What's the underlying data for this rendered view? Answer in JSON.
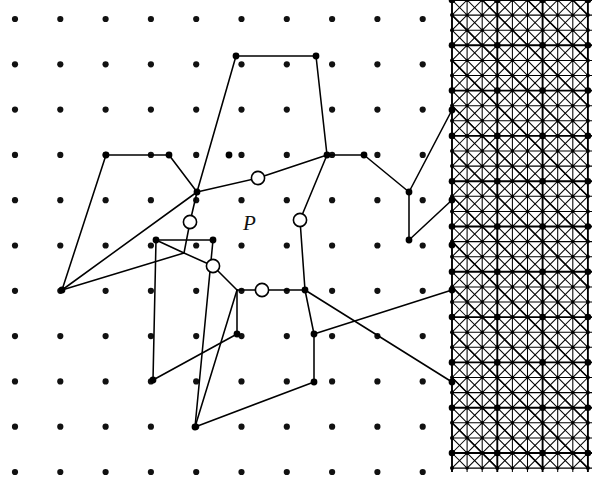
{
  "figure": {
    "width": 592,
    "height": 484,
    "background_color": "#ffffff",
    "stroke_color": "#000000",
    "label": {
      "text": "P",
      "x": 243,
      "y": 213,
      "style": "italic-serif"
    },
    "lattice": {
      "description": "background dot grid",
      "dot_radius": 3.1,
      "color": "#111111",
      "x_start": 15,
      "y_start": 19,
      "spacing_x": 45.3,
      "spacing_y": 45.3,
      "cols": 10,
      "rows": 11
    },
    "solid_vertices": {
      "radius": 3.4,
      "points": [
        [
          106,
          155
        ],
        [
          169,
          155
        ],
        [
          229,
          155
        ],
        [
          197,
          192
        ],
        [
          236,
          56
        ],
        [
          316,
          56
        ],
        [
          327,
          155
        ],
        [
          364,
          155
        ],
        [
          409,
          192
        ],
        [
          409,
          240
        ],
        [
          452,
          110
        ],
        [
          452,
          200
        ],
        [
          452,
          245
        ],
        [
          452,
          290
        ],
        [
          452,
          382
        ],
        [
          156,
          240
        ],
        [
          213,
          240
        ],
        [
          237,
          334
        ],
        [
          195,
          427
        ],
        [
          314,
          382
        ],
        [
          314,
          334
        ],
        [
          305,
          290
        ],
        [
          153,
          380
        ],
        [
          62,
          290
        ]
      ]
    },
    "open_vertices": {
      "radius": 6.6,
      "fill": "#ffffff",
      "points": [
        [
          258,
          178
        ],
        [
          190,
          222
        ],
        [
          213,
          266
        ],
        [
          262,
          290
        ],
        [
          300,
          220
        ]
      ]
    },
    "polygon_edges": [
      {
        "name": "upper-left-region",
        "points": [
          [
            106,
            155
          ],
          [
            169,
            155
          ],
          [
            197,
            192
          ]
        ]
      },
      {
        "name": "left-wedge",
        "points": [
          [
            106,
            155
          ],
          [
            62,
            290
          ],
          [
            197,
            192
          ]
        ]
      },
      {
        "name": "top-peak",
        "points": [
          [
            197,
            192
          ],
          [
            236,
            56
          ],
          [
            316,
            56
          ],
          [
            327,
            155
          ]
        ]
      },
      {
        "name": "top-right-edge",
        "points": [
          [
            327,
            155
          ],
          [
            364,
            155
          ],
          [
            409,
            192
          ]
        ]
      },
      {
        "name": "right-spine",
        "points": [
          [
            409,
            192
          ],
          [
            409,
            240
          ]
        ]
      },
      {
        "name": "right-upper-to-mesh",
        "points": [
          [
            409,
            192
          ],
          [
            452,
            110
          ]
        ]
      },
      {
        "name": "right-mid-to-mesh",
        "points": [
          [
            409,
            240
          ],
          [
            452,
            200
          ]
        ]
      },
      {
        "name": "right-lower-to-mesh",
        "points": [
          [
            314,
            334
          ],
          [
            452,
            290
          ]
        ]
      },
      {
        "name": "p-top-edge",
        "points": [
          [
            197,
            192
          ],
          [
            258,
            178
          ],
          [
            327,
            155
          ]
        ]
      },
      {
        "name": "p-left-edge",
        "points": [
          [
            197,
            192
          ],
          [
            190,
            222
          ],
          [
            184,
            253
          ]
        ]
      },
      {
        "name": "p-right-edge",
        "points": [
          [
            327,
            155
          ],
          [
            300,
            220
          ],
          [
            305,
            290
          ]
        ]
      },
      {
        "name": "p-lower-left-edge",
        "points": [
          [
            184,
            253
          ],
          [
            213,
            266
          ],
          [
            237,
            290
          ]
        ]
      },
      {
        "name": "p-bottom-edge",
        "points": [
          [
            237,
            290
          ],
          [
            262,
            290
          ],
          [
            305,
            290
          ]
        ]
      },
      {
        "name": "left-mid-spur",
        "points": [
          [
            156,
            240
          ],
          [
            184,
            253
          ]
        ]
      },
      {
        "name": "left-arm",
        "points": [
          [
            62,
            290
          ],
          [
            184,
            253
          ]
        ]
      },
      {
        "name": "left-upper-arm",
        "points": [
          [
            156,
            240
          ],
          [
            213,
            240
          ]
        ]
      },
      {
        "name": "left-lower-chain",
        "points": [
          [
            156,
            240
          ],
          [
            153,
            380
          ],
          [
            237,
            334
          ]
        ]
      },
      {
        "name": "long-diagonal",
        "points": [
          [
            213,
            240
          ],
          [
            195,
            427
          ]
        ]
      },
      {
        "name": "spur-down",
        "points": [
          [
            237,
            290
          ],
          [
            237,
            334
          ]
        ]
      },
      {
        "name": "spur-down-2",
        "points": [
          [
            237,
            290
          ],
          [
            195,
            427
          ]
        ]
      },
      {
        "name": "lower-right-chain",
        "points": [
          [
            305,
            290
          ],
          [
            314,
            334
          ],
          [
            314,
            382
          ],
          [
            195,
            427
          ]
        ]
      },
      {
        "name": "lower-mesh-link",
        "points": [
          [
            305,
            290
          ],
          [
            452,
            382
          ]
        ]
      }
    ],
    "mesh": {
      "name": "refined-triangular-mesh",
      "x_left": 452,
      "x_right": 592,
      "y_top": 0,
      "y_bottom": 472,
      "coarse_spacing": 45.3,
      "refinement": 3,
      "node_radius": 2.6,
      "description": "structured grid subdivided 3x3 per coarse cell with full diagonals in both directions"
    }
  }
}
